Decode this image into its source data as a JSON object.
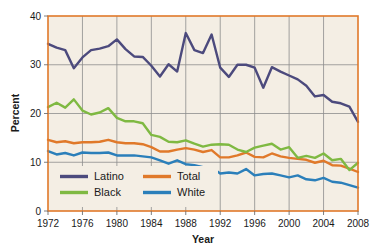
{
  "chart_data": {
    "type": "line",
    "title": "",
    "xlabel": "Year",
    "ylabel": "Percent",
    "xlim": [
      1972,
      2008
    ],
    "ylim": [
      0,
      40
    ],
    "xticks": [
      1972,
      1976,
      1980,
      1984,
      1988,
      1992,
      1996,
      2000,
      2004,
      2008
    ],
    "yticks": [
      0,
      10,
      20,
      30,
      40
    ],
    "grid": "horizontal-and-vertical",
    "legend_position": "inside-bottom-left",
    "x": [
      1972,
      1973,
      1974,
      1975,
      1976,
      1977,
      1978,
      1979,
      1980,
      1981,
      1982,
      1983,
      1984,
      1985,
      1986,
      1987,
      1988,
      1989,
      1990,
      1991,
      1992,
      1993,
      1994,
      1995,
      1996,
      1997,
      1998,
      1999,
      2000,
      2001,
      2002,
      2003,
      2004,
      2005,
      2006,
      2007,
      2008
    ],
    "series": [
      {
        "name": "Latino",
        "color": "#4c4a7d",
        "values": [
          34.3,
          33.5,
          33.0,
          29.3,
          31.5,
          33.0,
          33.3,
          33.8,
          35.2,
          33.2,
          31.7,
          31.6,
          29.8,
          27.6,
          30.1,
          28.6,
          36.5,
          33.0,
          32.4,
          36.2,
          29.4,
          27.5,
          30.0,
          30.0,
          29.4,
          25.3,
          29.5,
          28.6,
          27.8,
          27.0,
          25.7,
          23.5,
          23.8,
          22.4,
          22.1,
          21.4,
          18.3
        ]
      },
      {
        "name": "Black",
        "color": "#7fb942",
        "values": [
          21.3,
          22.2,
          21.2,
          22.9,
          20.6,
          19.8,
          20.2,
          21.1,
          19.1,
          18.4,
          18.4,
          18.0,
          15.6,
          15.2,
          14.2,
          14.1,
          14.5,
          13.8,
          13.2,
          13.6,
          13.7,
          13.6,
          12.6,
          12.1,
          13.0,
          13.4,
          13.8,
          12.6,
          13.1,
          10.9,
          11.3,
          10.9,
          11.8,
          10.4,
          10.7,
          8.4,
          9.9
        ]
      },
      {
        "name": "Total",
        "color": "#e0792a"
      },
      {
        "name": "White",
        "color": "#2b7fba"
      }
    ],
    "series_values": {
      "Total": [
        14.6,
        14.1,
        14.3,
        13.9,
        14.1,
        14.1,
        14.2,
        14.6,
        14.1,
        13.9,
        13.9,
        13.7,
        13.1,
        12.2,
        12.2,
        12.6,
        12.9,
        12.6,
        12.1,
        12.5,
        11.0,
        11.0,
        11.4,
        12.0,
        11.1,
        11.0,
        11.8,
        11.2,
        10.9,
        10.7,
        10.5,
        9.9,
        10.3,
        9.4,
        9.3,
        8.7,
        8.0
      ]
    },
    "series_values_white": [
      12.3,
      11.6,
      11.9,
      11.4,
      12.0,
      11.9,
      11.9,
      12.0,
      11.4,
      11.4,
      11.4,
      11.2,
      11.0,
      10.4,
      9.7,
      10.4,
      9.6,
      9.4,
      9.0,
      8.9,
      7.7,
      7.9,
      7.7,
      8.6,
      7.3,
      7.6,
      7.7,
      7.3,
      6.9,
      7.3,
      6.5,
      6.3,
      6.8,
      6.0,
      5.8,
      5.3,
      4.8
    ]
  },
  "axes": {
    "y_title": "Percent",
    "x_title": "Year",
    "y_tick_labels": [
      "0",
      "10",
      "20",
      "30",
      "40"
    ],
    "x_tick_labels": [
      "1972",
      "1976",
      "1980",
      "1984",
      "1988",
      "1992",
      "1996",
      "2000",
      "2004",
      "2008"
    ]
  },
  "legend": {
    "entries": [
      {
        "label": "Latino",
        "color": "#4c4a7d"
      },
      {
        "label": "Black",
        "color": "#7fb942"
      },
      {
        "label": "Total",
        "color": "#e0792a"
      },
      {
        "label": "White",
        "color": "#2b7fba"
      }
    ]
  },
  "colors": {
    "plot_background": "#f4eee4",
    "plot_border": "#e0792a",
    "gridline": "#8d8d8d",
    "text": "#1a1a1a",
    "page_background": "#ffffff"
  }
}
